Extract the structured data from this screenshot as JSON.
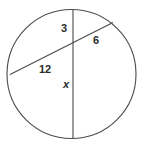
{
  "figure": {
    "background_color": "#ffffff",
    "stroke_color": "#4a4a4a",
    "label_color": "#2b2b2b",
    "circle": {
      "center_x": 71.5,
      "center_y": 74,
      "radius": 64.5
    },
    "diameter_line": {
      "name": "vertical-diameter",
      "x1": 73,
      "y1": 9.6,
      "x2": 73,
      "y2": 138.4
    },
    "chord_line": {
      "name": "transversal-chord",
      "x1": 10,
      "y1": 74.5,
      "x2": 113,
      "y2": 22.5
    },
    "intersection": {
      "x": 73,
      "y": 42.4
    },
    "labels": [
      {
        "id": "label-3",
        "name": "segment-label-3",
        "text": "3",
        "italic": false
      },
      {
        "id": "label-6",
        "name": "segment-label-6",
        "text": "6",
        "italic": false
      },
      {
        "id": "label-12",
        "name": "segment-label-12",
        "text": "12",
        "italic": false
      },
      {
        "id": "label-x",
        "name": "segment-label-x",
        "text": "x",
        "italic": true
      }
    ]
  }
}
